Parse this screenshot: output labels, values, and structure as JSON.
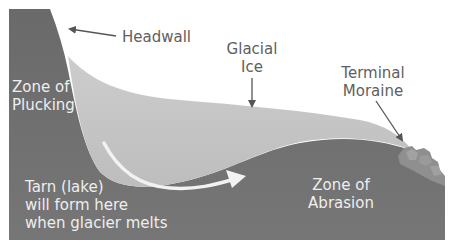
{
  "diagram": {
    "labels": {
      "headwall": "Headwall",
      "glacial_ice": [
        "Glacial",
        "Ice"
      ],
      "terminal_moraine": [
        "Terminal",
        "Moraine"
      ],
      "zone_of_plucking": [
        "Zone of",
        "Plucking"
      ],
      "tarn": [
        "Tarn (lake)",
        "will form here",
        "when glacier melts"
      ],
      "zone_of_abrasion": [
        "Zone of",
        "Abrasion"
      ]
    },
    "colors": {
      "bedrock": "#6e6e6e",
      "ice": "#c4c4c4",
      "flow_arrow": "#f2f2f2",
      "moraine": "#8f8f8f",
      "label_dark": "#606060",
      "label_light": "#eeeeee",
      "pointer": "#555555"
    }
  }
}
